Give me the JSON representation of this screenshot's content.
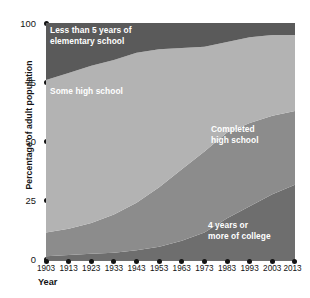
{
  "chart_data": {
    "type": "area",
    "title": "",
    "subtitle": "",
    "xlabel": "Year",
    "ylabel": "Percentage of adult population",
    "x": [
      1903,
      1913,
      1923,
      1933,
      1943,
      1953,
      1963,
      1973,
      1983,
      1993,
      2003,
      2013
    ],
    "xtick_labels": [
      "1903",
      "1913",
      "1923",
      "1933",
      "1943",
      "1953",
      "1963",
      "1973",
      "1983",
      "1993",
      "2003",
      "2013"
    ],
    "ytick_labels": [
      "0",
      "25",
      "50",
      "75",
      "100"
    ],
    "ytick_values": [
      0,
      25,
      50,
      75,
      100
    ],
    "ylim": [
      0,
      100
    ],
    "xlim": [
      1903,
      2013
    ],
    "grid": false,
    "legend": "inline-band-labels",
    "stacked": true,
    "stack_order_bottom_to_top": [
      "4 years or more of college",
      "Completed high school",
      "Some high school",
      "Less than 5 years of elementary school"
    ],
    "series": [
      {
        "name": "4 years or more of college",
        "color": "#6e6e6e",
        "label_text": "4 years or\nmore of college",
        "values": [
          2,
          2.5,
          3,
          3.5,
          4.5,
          6,
          8.5,
          12,
          18,
          23,
          28,
          32
        ]
      },
      {
        "name": "Completed high school",
        "color": "#8c8c8c",
        "label_text": "Completed\nhigh school",
        "values": [
          10,
          11,
          13,
          16,
          20,
          25,
          30,
          34,
          36,
          35,
          33,
          31
        ]
      },
      {
        "name": "Some high school",
        "color": "#b3b3b3",
        "label_text": "Some high school",
        "values": [
          64,
          65.5,
          66,
          65,
          63,
          58,
          51,
          44,
          38,
          36,
          34,
          32
        ]
      },
      {
        "name": "Less than 5 years of elementary school",
        "color": "#5a5a5a",
        "label_text": "Less than 5 years of\nelementary school",
        "values": [
          24,
          21,
          18,
          15.5,
          12.5,
          11,
          10.5,
          10,
          8,
          6,
          5,
          5
        ]
      }
    ],
    "colors": {
      "elementary": "#5a5a5a",
      "some_high_school": "#b3b3b3",
      "completed_high_school": "#8c8c8c",
      "college": "#6e6e6e",
      "axis": "#141414",
      "label_text": "#ffffff",
      "background": "#ffffff"
    }
  }
}
